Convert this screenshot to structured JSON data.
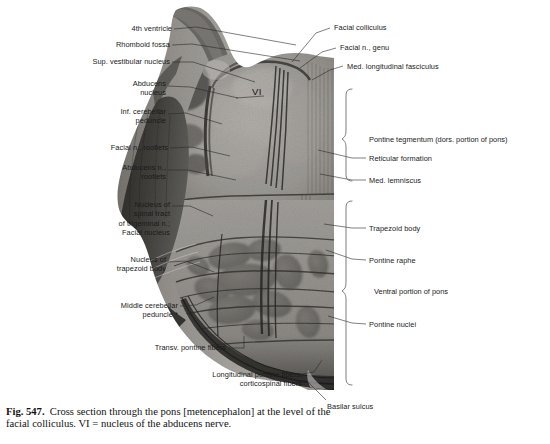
{
  "figure": {
    "number": "Fig. 547.",
    "caption": "Cross section through the pons [metencephalon] at the level of the facial colliculus. VI = nucleus of the abducens nerve.",
    "on_image_marks": [
      {
        "text": "VI",
        "x": 252,
        "y": 90
      }
    ]
  },
  "labels_left": [
    {
      "id": "fourth-ventricle",
      "text": "4th ventricle",
      "x": 170,
      "y": 27
    },
    {
      "id": "rhomboid-fossa",
      "text": "Rhomboid fossa",
      "x": 168,
      "y": 43
    },
    {
      "id": "sup-vestibular-nucleus",
      "text": "Sup. vestibular nucleus",
      "x": 168,
      "y": 60
    },
    {
      "id": "abducens-nucleus",
      "text": "Abducens\nnucleus",
      "x": 133,
      "y": 82
    },
    {
      "id": "inf-cerebellar-peduncle",
      "text": "Inf. cerebellar\npeduncle",
      "x": 120,
      "y": 110
    },
    {
      "id": "facial-n-rootlets",
      "text": "Facial n., rootlets",
      "x": 130,
      "y": 146
    },
    {
      "id": "abducens-n-rootlets",
      "text": "Abducens n.,\nrootlets",
      "x": 122,
      "y": 166
    },
    {
      "id": "nucleus-spinal-trigeminal",
      "text": "Nucleus of\nspinal tract\nof trigeminal n.;\nFacial nucleus",
      "x": 127,
      "y": 203
    },
    {
      "id": "nucleus-trapezoid-body",
      "text": "Nucleus of\ntrapezoid body",
      "x": 121,
      "y": 258
    },
    {
      "id": "middle-cerebellar-peduncle",
      "text": "Middle cerebellar\npeduncle *",
      "x": 136,
      "y": 304
    },
    {
      "id": "transv-pontine-fibers",
      "text": "Transv. pontine fibers",
      "x": 176,
      "y": 346
    },
    {
      "id": "longitudinal-pontine-fibers",
      "text": "Longitudinal pontine fibers;\ncorticospinal fibers",
      "x": 254,
      "y": 373
    }
  ],
  "labels_right": [
    {
      "id": "facial-colliculus",
      "text": "Facial colliculus",
      "x": 334,
      "y": 26
    },
    {
      "id": "facial-n-genu",
      "text": "Facial n., genu",
      "x": 340,
      "y": 46
    },
    {
      "id": "med-longitudinal-fasciculus",
      "text": "Med. longitudinal fasciculus",
      "x": 347,
      "y": 65
    },
    {
      "id": "reticular-formation",
      "text": "Reticular formation",
      "x": 369,
      "y": 157
    },
    {
      "id": "med-lemniscus",
      "text": "Med. lemniscus",
      "x": 369,
      "y": 178
    },
    {
      "id": "trapezoid-body",
      "text": "Trapezoid body",
      "x": 369,
      "y": 227
    },
    {
      "id": "pontine-raphe",
      "text": "Pontine raphe",
      "x": 369,
      "y": 258
    },
    {
      "id": "pontine-nuclei",
      "text": "Pontine nuclei",
      "x": 369,
      "y": 322
    },
    {
      "id": "basilar-sulcus",
      "text": "Basilar sulcus",
      "x": 327,
      "y": 405
    }
  ],
  "brace_labels": [
    {
      "id": "pontine-tegmentum",
      "text": "Pontine tegmentum (dors. portion of pons)",
      "x": 369,
      "y": 139
    },
    {
      "id": "ventral-portion-pons",
      "text": "Ventral portion of pons",
      "x": 374,
      "y": 291
    }
  ],
  "colors": {
    "ink": "#1a1a1a",
    "leader": "#2a2a2a",
    "brace": "#5a5a5a",
    "page_background": "#ffffff",
    "tissue_light": "#b9b7b2",
    "tissue_mid": "#8d8b87",
    "tissue_dark": "#53514e",
    "tissue_darkest": "#2e2d2b"
  }
}
